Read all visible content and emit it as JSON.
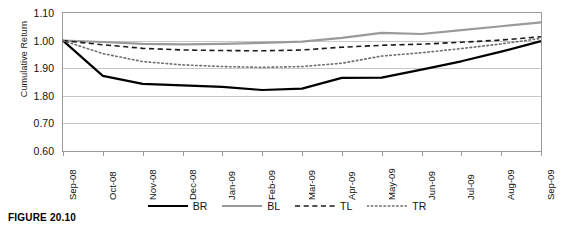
{
  "figure": {
    "caption": "FIGURE 20.10"
  },
  "chart_data": {
    "type": "line",
    "title": "",
    "xlabel": "",
    "ylabel": "Cumulative Return",
    "ylim": [
      0.6,
      1.1
    ],
    "ytick_labels": [
      "1.10",
      "1.00",
      "1.90",
      "1.80",
      "0.70",
      "0.60"
    ],
    "ytick_values": [
      1.1,
      1.0,
      0.9,
      0.8,
      0.7,
      0.6
    ],
    "grid": true,
    "legend_position": "bottom",
    "categories": [
      "Sep-08",
      "Oct-08",
      "Nov-08",
      "Dec-08",
      "Jan-09",
      "Feb-09",
      "Mar-09",
      "Apr-09",
      "May-09",
      "Jun-09",
      "Jul-09",
      "Aug-09",
      "Sep-09"
    ],
    "series": [
      {
        "name": "BR",
        "style": "solid",
        "color": "#000000",
        "width": 2.2,
        "values": [
          1.0,
          0.872,
          0.843,
          0.838,
          0.832,
          0.821,
          0.826,
          0.865,
          0.866,
          0.895,
          0.925,
          0.96,
          0.998
        ]
      },
      {
        "name": "BL",
        "style": "solid",
        "color": "#9a9a9a",
        "width": 2.2,
        "values": [
          1.0,
          0.995,
          0.988,
          0.986,
          0.988,
          0.992,
          0.996,
          1.01,
          1.028,
          1.024,
          1.038,
          1.052,
          1.066
        ]
      },
      {
        "name": "TL",
        "style": "dashed",
        "color": "#1a1a1a",
        "width": 1.6,
        "values": [
          1.0,
          0.985,
          0.972,
          0.966,
          0.964,
          0.963,
          0.966,
          0.976,
          0.983,
          0.987,
          0.994,
          1.002,
          1.014
        ]
      },
      {
        "name": "TR",
        "style": "dotted",
        "color": "#6e6e6e",
        "width": 1.6,
        "values": [
          1.0,
          0.953,
          0.924,
          0.912,
          0.906,
          0.903,
          0.906,
          0.918,
          0.944,
          0.956,
          0.971,
          0.988,
          1.008
        ]
      }
    ]
  }
}
